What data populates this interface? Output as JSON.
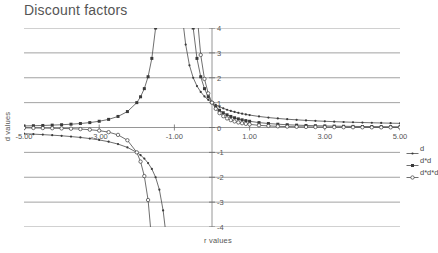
{
  "chart_data": {
    "type": "line",
    "title": "Discount factors",
    "xlabel": "r values",
    "ylabel": "d values",
    "xlim": [
      -5,
      5
    ],
    "ylim": [
      -4,
      4
    ],
    "grid": true,
    "legend_position": "right",
    "xticks": [
      "-5.00",
      "-3.00",
      "-1.00",
      "1.00",
      "3.00",
      "5.00"
    ],
    "xtick_values": [
      -5,
      -3,
      -1,
      1,
      3,
      5
    ],
    "yticks": [
      "4",
      "3",
      "2",
      "1",
      "0",
      "-1",
      "-2",
      "-3",
      "-4"
    ],
    "ytick_values": [
      4,
      3,
      2,
      1,
      0,
      -1,
      -2,
      -3,
      -4
    ],
    "asymptote_x": -1,
    "note": "d = 1/(1+r); curves show d, d^2 and d^3 with a vertical asymptote at r = -1",
    "x": [
      -5.0,
      -4.75,
      -4.5,
      -4.25,
      -4.0,
      -3.75,
      -3.5,
      -3.25,
      -3.0,
      -2.75,
      -2.5,
      -2.25,
      -2.0,
      -1.9,
      -1.8,
      -1.7,
      -1.6,
      -1.5,
      -1.4,
      -1.3,
      -1.2,
      -1.1,
      -0.9,
      -0.8,
      -0.7,
      -0.6,
      -0.5,
      -0.4,
      -0.3,
      -0.2,
      -0.1,
      0.0,
      0.1,
      0.2,
      0.3,
      0.4,
      0.5,
      0.6,
      0.7,
      0.8,
      0.9,
      1.0,
      1.25,
      1.5,
      1.75,
      2.0,
      2.25,
      2.5,
      2.75,
      3.0,
      3.25,
      3.5,
      3.75,
      4.0,
      4.25,
      4.5,
      4.75,
      5.0
    ],
    "series": [
      {
        "name": "d",
        "marker": "dot",
        "color": "#4a4a4a",
        "values": [
          -0.25,
          -0.267,
          -0.286,
          -0.308,
          -0.333,
          -0.364,
          -0.4,
          -0.444,
          -0.5,
          -0.571,
          -0.667,
          -0.8,
          -1.0,
          -1.111,
          -1.25,
          -1.429,
          -1.667,
          -2.0,
          -2.5,
          -3.333,
          -5.0,
          -10.0,
          10.0,
          5.0,
          3.333,
          2.5,
          2.0,
          1.667,
          1.429,
          1.25,
          1.111,
          1.0,
          0.909,
          0.833,
          0.769,
          0.714,
          0.667,
          0.625,
          0.588,
          0.556,
          0.526,
          0.5,
          0.444,
          0.4,
          0.364,
          0.333,
          0.308,
          0.286,
          0.267,
          0.25,
          0.235,
          0.222,
          0.211,
          0.2,
          0.19,
          0.182,
          0.174,
          0.167
        ]
      },
      {
        "name": "d*d",
        "marker": "square",
        "color": "#4a4a4a",
        "values": [
          0.0625,
          0.0711,
          0.0816,
          0.0947,
          0.1111,
          0.1322,
          0.16,
          0.1975,
          0.25,
          0.3265,
          0.4444,
          0.64,
          1.0,
          1.2346,
          1.5625,
          2.0408,
          2.7778,
          4.0,
          6.25,
          11.111,
          25.0,
          100.0,
          100.0,
          25.0,
          11.111,
          6.25,
          4.0,
          2.7778,
          2.0408,
          1.5625,
          1.2346,
          1.0,
          0.8264,
          0.6944,
          0.5917,
          0.5102,
          0.4444,
          0.3906,
          0.346,
          0.3086,
          0.277,
          0.25,
          0.1975,
          0.16,
          0.1322,
          0.1111,
          0.0947,
          0.0816,
          0.0711,
          0.0625,
          0.0554,
          0.0494,
          0.0443,
          0.04,
          0.0363,
          0.0331,
          0.0302,
          0.0278
        ]
      },
      {
        "name": "d*d*d",
        "marker": "circle",
        "color": "#4a4a4a",
        "values": [
          -0.0156,
          -0.019,
          -0.0233,
          -0.0291,
          -0.037,
          -0.0481,
          -0.064,
          -0.0878,
          -0.125,
          -0.1866,
          -0.2963,
          -0.512,
          -1.0,
          -1.3717,
          -1.9531,
          -2.9155,
          -4.6296,
          -8.0,
          -15.625,
          -37.037,
          -125.0,
          -1000.0,
          1000.0,
          125.0,
          37.037,
          15.625,
          8.0,
          4.6296,
          2.9155,
          1.9531,
          1.3717,
          1.0,
          0.7513,
          0.5787,
          0.4552,
          0.3644,
          0.2963,
          0.2441,
          0.2035,
          0.1715,
          0.1458,
          0.125,
          0.0878,
          0.064,
          0.0481,
          0.037,
          0.0291,
          0.0233,
          0.019,
          0.0156,
          0.013,
          0.011,
          0.0093,
          0.008,
          0.0069,
          0.006,
          0.0053,
          0.0046
        ]
      }
    ]
  },
  "legend": {
    "items": [
      {
        "label": "d"
      },
      {
        "label": "d*d"
      },
      {
        "label": "d*d*d"
      }
    ]
  }
}
